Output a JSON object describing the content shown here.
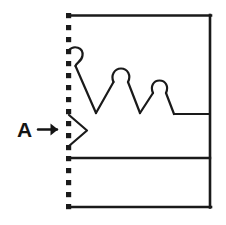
{
  "figure": {
    "title": "",
    "background_color": "#ffffff",
    "stroke_color": "#1a1a1a",
    "canvas": {
      "width": 226,
      "height": 225
    },
    "annotation": {
      "label": "A",
      "arrow_glyph": "→",
      "points_to": "chevron-notch-on-dotted-edge"
    },
    "borders": {
      "top_label": "top-border",
      "right_label": "right-border",
      "bottom_label": "bottom-border",
      "left_label": "left-dotted-border",
      "left_style": "dotted"
    },
    "dividers": [
      {
        "name": "upper-divider",
        "y": 114
      },
      {
        "name": "middle-divider",
        "y": 158
      }
    ],
    "geometry": {
      "frame": {
        "x_left": 68,
        "x_right": 211,
        "y_top": 15,
        "y_bottom": 207
      },
      "dotted_dot_count": 17,
      "dotted_dot_size": 5,
      "dotted_spacing": 12,
      "zigzag": {
        "peaks": [
          {
            "name": "peak-1",
            "x": 74,
            "y": 52,
            "loop": "open-left"
          },
          {
            "name": "peak-2",
            "x": 120,
            "y": 78,
            "loop": "closed"
          },
          {
            "name": "peak-3",
            "x": 159,
            "y": 90,
            "loop": "closed"
          }
        ],
        "valleys": [
          {
            "name": "valley-1",
            "x": 96,
            "y": 113
          },
          {
            "name": "valley-2",
            "x": 140,
            "y": 113
          }
        ],
        "tail": {
          "from_x": 172,
          "to_x": 211,
          "y": 114
        }
      },
      "chevron": {
        "tip_x": 87,
        "tip_y": 130,
        "top_y": 115,
        "bottom_y": 146
      }
    }
  }
}
